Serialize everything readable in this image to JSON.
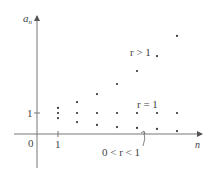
{
  "axes": {
    "y_label": "a",
    "y_label_sub": "n",
    "x_label": "n",
    "origin_label": "0",
    "y_tick_label": "1",
    "x_tick_label": "1"
  },
  "annotations": {
    "r_gt_1": "r > 1",
    "r_eq_1": "r = 1",
    "r_between": "0 < r < 1"
  },
  "chart_data": {
    "type": "scatter",
    "title": "",
    "xlabel": "n",
    "ylabel": "a_n",
    "x": [
      1,
      2,
      3,
      4,
      5,
      6,
      7
    ],
    "series": [
      {
        "name": "r > 1",
        "values": [
          1.24,
          1.52,
          1.9,
          2.38,
          3.0,
          3.71,
          4.67
        ]
      },
      {
        "name": "r = 1",
        "values": [
          1,
          1,
          1,
          1,
          1,
          1,
          1
        ]
      },
      {
        "name": "0 < r < 1",
        "values": [
          0.76,
          0.57,
          0.43,
          0.33,
          0.29,
          0.24,
          0.14
        ]
      }
    ],
    "ylim": [
      -1.6,
      5.5
    ],
    "grid": false
  }
}
